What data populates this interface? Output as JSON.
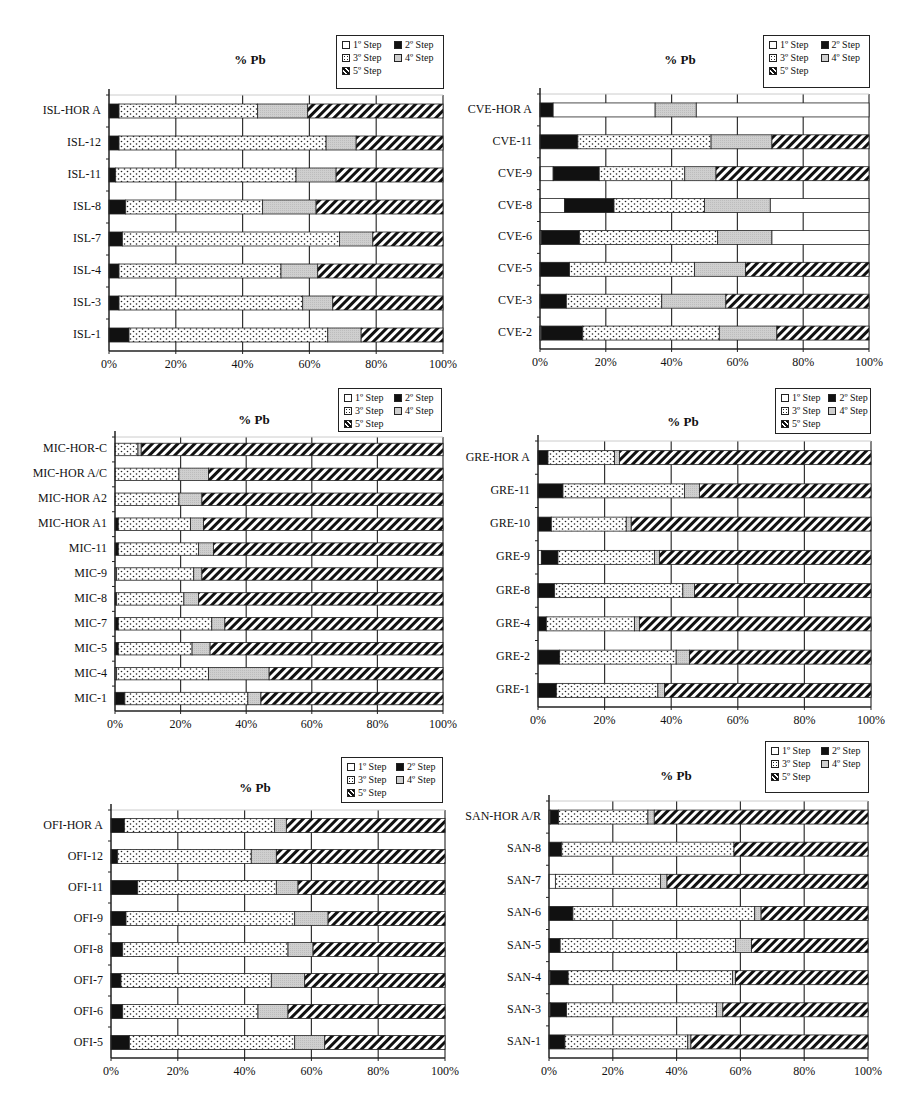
{
  "legend": {
    "items": [
      {
        "key": "s1",
        "label": "1º Step",
        "pattern": "white"
      },
      {
        "key": "s2",
        "label": "2º Step",
        "pattern": "black"
      },
      {
        "key": "s3",
        "label": "3º Step",
        "pattern": "dots"
      },
      {
        "key": "s4",
        "label": "4º Step",
        "pattern": "gray"
      },
      {
        "key": "s5",
        "label": "5º Step",
        "pattern": "hatch"
      }
    ]
  },
  "colors": {
    "black": "#111111",
    "gray": "#cfcfcf",
    "white": "#ffffff",
    "hatch": "#111111",
    "axis": "#222222",
    "grid": "#333333"
  },
  "chart_data": [
    {
      "id": "ISL",
      "type": "bar",
      "orientation": "horizontal",
      "stacked": true,
      "title": "% Pb",
      "xlabel": "",
      "ylabel": "",
      "xlim": [
        0,
        100
      ],
      "ticks": [
        "0%",
        "20%",
        "40%",
        "60%",
        "80%",
        "100%"
      ],
      "series_order": [
        "1º Step",
        "2º Step",
        "3º Step",
        "4º Step",
        "5º Step"
      ],
      "layout": {
        "left": 109,
        "top": 95,
        "right": 443,
        "bottom": 351,
        "title_x": 250,
        "title_y": 52,
        "legend_x": 336,
        "legend_y": 35,
        "legend_w": 108,
        "legend_h": 54
      },
      "categories": [
        "ISL-HOR A",
        "ISL-12",
        "ISL-11",
        "ISL-8",
        "ISL-7",
        "ISL-4",
        "ISL-3",
        "ISL-1"
      ],
      "rows": [
        [
          [
            "black",
            3
          ],
          [
            "dots",
            41.5
          ],
          [
            "gray",
            15
          ],
          [
            "hatch",
            40.5
          ]
        ],
        [
          [
            "black",
            3
          ],
          [
            "dots",
            62
          ],
          [
            "gray",
            9
          ],
          [
            "hatch",
            26
          ]
        ],
        [
          [
            "black",
            2
          ],
          [
            "dots",
            54
          ],
          [
            "gray",
            12
          ],
          [
            "hatch",
            32
          ]
        ],
        [
          [
            "black",
            5
          ],
          [
            "dots",
            41
          ],
          [
            "gray",
            16
          ],
          [
            "hatch",
            38
          ]
        ],
        [
          [
            "black",
            4
          ],
          [
            "dots",
            65
          ],
          [
            "gray",
            10
          ],
          [
            "hatch",
            21
          ]
        ],
        [
          [
            "black",
            3
          ],
          [
            "dots",
            48.5
          ],
          [
            "gray",
            11
          ],
          [
            "hatch",
            37.5
          ]
        ],
        [
          [
            "black",
            3
          ],
          [
            "dots",
            55
          ],
          [
            "gray",
            9
          ],
          [
            "hatch",
            33
          ]
        ],
        [
          [
            "black",
            6
          ],
          [
            "dots",
            59.5
          ],
          [
            "gray",
            10
          ],
          [
            "hatch",
            24.5
          ]
        ]
      ]
    },
    {
      "id": "CVE",
      "type": "bar",
      "orientation": "horizontal",
      "stacked": true,
      "title": "% Pb",
      "xlabel": "",
      "ylabel": "",
      "xlim": [
        0,
        100
      ],
      "ticks": [
        "0%",
        "20%",
        "40%",
        "60%",
        "80%",
        "100%"
      ],
      "series_order": [
        "1º Step",
        "2º Step",
        "3º Step",
        "4º Step",
        "5º Step"
      ],
      "layout": {
        "left": 540,
        "top": 94,
        "right": 869,
        "bottom": 349,
        "title_x": 680,
        "title_y": 52,
        "legend_x": 763,
        "legend_y": 35,
        "legend_w": 107,
        "legend_h": 53
      },
      "categories": [
        "CVE-HOR A",
        "CVE-11",
        "CVE-9",
        "CVE-8",
        "CVE-6",
        "CVE-5",
        "CVE-3",
        "CVE-2"
      ],
      "rows": [
        [
          [
            "black",
            4
          ],
          [
            "white",
            31
          ],
          [
            "gray",
            12.5
          ],
          [
            "white",
            52.5
          ]
        ],
        [
          [
            "black",
            11.5
          ],
          [
            "dots",
            40.5
          ],
          [
            "gray",
            18.5
          ],
          [
            "hatch",
            29.5
          ]
        ],
        [
          [
            "white",
            4
          ],
          [
            "black",
            14
          ],
          [
            "dots",
            26
          ],
          [
            "gray",
            9.5
          ],
          [
            "hatch",
            46.5
          ]
        ],
        [
          [
            "white",
            7.5
          ],
          [
            "black",
            15
          ],
          [
            "dots",
            27.5
          ],
          [
            "gray",
            20
          ],
          [
            "white",
            30
          ]
        ],
        [
          [
            "white",
            0.5
          ],
          [
            "black",
            11.5
          ],
          [
            "dots",
            42
          ],
          [
            "gray",
            16.5
          ],
          [
            "white",
            29.5
          ]
        ],
        [
          [
            "black",
            9
          ],
          [
            "dots",
            38
          ],
          [
            "gray",
            15.5
          ],
          [
            "hatch",
            37.5
          ]
        ],
        [
          [
            "black",
            8
          ],
          [
            "dots",
            29
          ],
          [
            "gray",
            19.5
          ],
          [
            "hatch",
            43.5
          ]
        ],
        [
          [
            "white",
            0.5
          ],
          [
            "black",
            12.5
          ],
          [
            "dots",
            41.5
          ],
          [
            "gray",
            17.5
          ],
          [
            "hatch",
            28
          ]
        ]
      ]
    },
    {
      "id": "MIC",
      "type": "bar",
      "orientation": "horizontal",
      "stacked": true,
      "title": "% Pb",
      "xlabel": "",
      "ylabel": "",
      "xlim": [
        0,
        100
      ],
      "ticks": [
        "0%",
        "20%",
        "40%",
        "60%",
        "80%",
        "100%"
      ],
      "series_order": [
        "1º Step",
        "2º Step",
        "3º Step",
        "4º Step",
        "5º Step"
      ],
      "layout": {
        "left": 115,
        "top": 437,
        "right": 443,
        "bottom": 711,
        "title_x": 254,
        "title_y": 412,
        "legend_x": 338,
        "legend_y": 388,
        "legend_w": 104,
        "legend_h": 44
      },
      "categories": [
        "MIC-HOR-C",
        "MIC-HOR A/C",
        "MIC-HOR A2",
        "MIC-HOR A1",
        "MIC-11",
        "MIC-9",
        "MIC-8",
        "MIC-7",
        "MIC-5",
        "MIC-4",
        "MIC-1"
      ],
      "rows": [
        [
          [
            "dots",
            7
          ],
          [
            "gray",
            1
          ],
          [
            "hatch",
            92
          ]
        ],
        [
          [
            "dots",
            19.5
          ],
          [
            "gray",
            9
          ],
          [
            "hatch",
            71.5
          ]
        ],
        [
          [
            "dots",
            19.5
          ],
          [
            "gray",
            7
          ],
          [
            "hatch",
            73.5
          ]
        ],
        [
          [
            "black",
            1
          ],
          [
            "dots",
            22
          ],
          [
            "gray",
            4
          ],
          [
            "hatch",
            73
          ]
        ],
        [
          [
            "black",
            1
          ],
          [
            "dots",
            24.5
          ],
          [
            "gray",
            4.5
          ],
          [
            "hatch",
            70
          ]
        ],
        [
          [
            "white",
            0.5
          ],
          [
            "dots",
            23.5
          ],
          [
            "gray",
            2.5
          ],
          [
            "hatch",
            73.5
          ]
        ],
        [
          [
            "black",
            0.5
          ],
          [
            "dots",
            20.5
          ],
          [
            "gray",
            4.5
          ],
          [
            "hatch",
            74.5
          ]
        ],
        [
          [
            "black",
            1
          ],
          [
            "dots",
            28.5
          ],
          [
            "gray",
            4
          ],
          [
            "hatch",
            66.5
          ]
        ],
        [
          [
            "black",
            1
          ],
          [
            "dots",
            22.5
          ],
          [
            "gray",
            5.5
          ],
          [
            "hatch",
            71
          ]
        ],
        [
          [
            "white",
            0.5
          ],
          [
            "dots",
            28
          ],
          [
            "gray",
            18.5
          ],
          [
            "hatch",
            53
          ]
        ],
        [
          [
            "black",
            3
          ],
          [
            "dots",
            37.5
          ],
          [
            "gray",
            4
          ],
          [
            "hatch",
            55.5
          ]
        ]
      ]
    },
    {
      "id": "GRE",
      "type": "bar",
      "orientation": "horizontal",
      "stacked": true,
      "title": "% Pb",
      "xlabel": "",
      "ylabel": "",
      "xlim": [
        0,
        100
      ],
      "ticks": [
        "0%",
        "20%",
        "40%",
        "60%",
        "80%",
        "100%"
      ],
      "series_order": [
        "1º Step",
        "2º Step",
        "3º Step",
        "4º Step",
        "5º Step"
      ],
      "layout": {
        "left": 538,
        "top": 441,
        "right": 871,
        "bottom": 707,
        "title_x": 683,
        "title_y": 414,
        "legend_x": 775,
        "legend_y": 388,
        "legend_w": 96,
        "legend_h": 46
      },
      "categories": [
        "GRE-HOR A",
        "GRE-11",
        "GRE-10",
        "GRE-9",
        "GRE-8",
        "GRE-4",
        "GRE-2",
        "GRE-1"
      ],
      "rows": [
        [
          [
            "black",
            3
          ],
          [
            "dots",
            20
          ],
          [
            "gray",
            1.5
          ],
          [
            "hatch",
            75.5
          ]
        ],
        [
          [
            "black",
            7.5
          ],
          [
            "dots",
            36.5
          ],
          [
            "gray",
            4.5
          ],
          [
            "hatch",
            51.5
          ]
        ],
        [
          [
            "black",
            4
          ],
          [
            "dots",
            22.5
          ],
          [
            "gray",
            1.5
          ],
          [
            "hatch",
            72
          ]
        ],
        [
          [
            "white",
            1
          ],
          [
            "black",
            5
          ],
          [
            "dots",
            29
          ],
          [
            "gray",
            1.5
          ],
          [
            "hatch",
            63.5
          ]
        ],
        [
          [
            "black",
            5
          ],
          [
            "dots",
            38.5
          ],
          [
            "gray",
            3.5
          ],
          [
            "hatch",
            53
          ]
        ],
        [
          [
            "black",
            2.5
          ],
          [
            "dots",
            26.5
          ],
          [
            "gray",
            1.5
          ],
          [
            "hatch",
            69.5
          ]
        ],
        [
          [
            "black",
            6.5
          ],
          [
            "dots",
            35
          ],
          [
            "gray",
            4
          ],
          [
            "hatch",
            54.5
          ]
        ],
        [
          [
            "black",
            5.5
          ],
          [
            "dots",
            30.5
          ],
          [
            "gray",
            2
          ],
          [
            "hatch",
            62
          ]
        ]
      ]
    },
    {
      "id": "OFI",
      "type": "bar",
      "orientation": "horizontal",
      "stacked": true,
      "title": "% Pb",
      "xlabel": "",
      "ylabel": "",
      "xlim": [
        0,
        100
      ],
      "ticks": [
        "0%",
        "20%",
        "40%",
        "60%",
        "80%",
        "100%"
      ],
      "series_order": [
        "1º Step",
        "2º Step",
        "3º Step",
        "4º Step",
        "5º Step"
      ],
      "layout": {
        "left": 111,
        "top": 810,
        "right": 445,
        "bottom": 1058,
        "title_x": 255,
        "title_y": 780,
        "legend_x": 341,
        "legend_y": 757,
        "legend_w": 102,
        "legend_h": 46
      },
      "categories": [
        "OFI-HOR A",
        "OFI-12",
        "OFI-11",
        "OFI-9",
        "OFI-8",
        "OFI-7",
        "OFI-6",
        "OFI-5"
      ],
      "rows": [
        [
          [
            "black",
            4
          ],
          [
            "dots",
            45
          ],
          [
            "gray",
            3.5
          ],
          [
            "hatch",
            47.5
          ]
        ],
        [
          [
            "black",
            2
          ],
          [
            "dots",
            40
          ],
          [
            "gray",
            7.5
          ],
          [
            "hatch",
            50.5
          ]
        ],
        [
          [
            "black",
            8
          ],
          [
            "dots",
            41.5
          ],
          [
            "gray",
            6.5
          ],
          [
            "hatch",
            44
          ]
        ],
        [
          [
            "black",
            4.5
          ],
          [
            "dots",
            50.5
          ],
          [
            "gray",
            10
          ],
          [
            "hatch",
            35
          ]
        ],
        [
          [
            "black",
            3.5
          ],
          [
            "dots",
            49.5
          ],
          [
            "gray",
            7.5
          ],
          [
            "hatch",
            39.5
          ]
        ],
        [
          [
            "black",
            3
          ],
          [
            "dots",
            45
          ],
          [
            "gray",
            10
          ],
          [
            "hatch",
            42
          ]
        ],
        [
          [
            "black",
            3.5
          ],
          [
            "dots",
            40.5
          ],
          [
            "gray",
            9
          ],
          [
            "hatch",
            47
          ]
        ],
        [
          [
            "black",
            5.5
          ],
          [
            "dots",
            49.5
          ],
          [
            "gray",
            9
          ],
          [
            "hatch",
            36
          ]
        ]
      ]
    },
    {
      "id": "SAN",
      "type": "bar",
      "orientation": "horizontal",
      "stacked": true,
      "title": "% Pb",
      "xlabel": "",
      "ylabel": "",
      "xlim": [
        0,
        100
      ],
      "ticks": [
        "0%",
        "20%",
        "40%",
        "60%",
        "80%",
        "100%"
      ],
      "series_order": [
        "1º Step",
        "2º Step",
        "3º Step",
        "4º Step",
        "5º Step"
      ],
      "layout": {
        "left": 549,
        "top": 801,
        "right": 868,
        "bottom": 1058,
        "title_x": 676,
        "title_y": 768,
        "legend_x": 765,
        "legend_y": 741,
        "legend_w": 104,
        "legend_h": 52
      },
      "categories": [
        "SAN-HOR A/R",
        "SAN-8",
        "SAN-7",
        "SAN-6",
        "SAN-5",
        "SAN-4",
        "SAN-3",
        "SAN-1"
      ],
      "rows": [
        [
          [
            "white",
            0.5
          ],
          [
            "black",
            2.5
          ],
          [
            "dots",
            28
          ],
          [
            "gray",
            2
          ],
          [
            "hatch",
            67
          ]
        ],
        [
          [
            "black",
            4
          ],
          [
            "dots",
            54
          ],
          [
            "hatch",
            42
          ]
        ],
        [
          [
            "white",
            2
          ],
          [
            "dots",
            33
          ],
          [
            "gray",
            2
          ],
          [
            "hatch",
            63
          ]
        ],
        [
          [
            "black",
            7.5
          ],
          [
            "dots",
            57
          ],
          [
            "gray",
            2
          ],
          [
            "hatch",
            33.5
          ]
        ],
        [
          [
            "black",
            3.5
          ],
          [
            "dots",
            55
          ],
          [
            "gray",
            5
          ],
          [
            "hatch",
            36.5
          ]
        ],
        [
          [
            "white",
            0.5
          ],
          [
            "black",
            5.5
          ],
          [
            "dots",
            51.5
          ],
          [
            "gray",
            1
          ],
          [
            "hatch",
            41.5
          ]
        ],
        [
          [
            "white",
            0.5
          ],
          [
            "black",
            5
          ],
          [
            "dots",
            47
          ],
          [
            "gray",
            2
          ],
          [
            "hatch",
            45.5
          ]
        ],
        [
          [
            "black",
            5
          ],
          [
            "dots",
            38.5
          ],
          [
            "gray",
            1
          ],
          [
            "hatch",
            55.5
          ]
        ]
      ]
    }
  ]
}
